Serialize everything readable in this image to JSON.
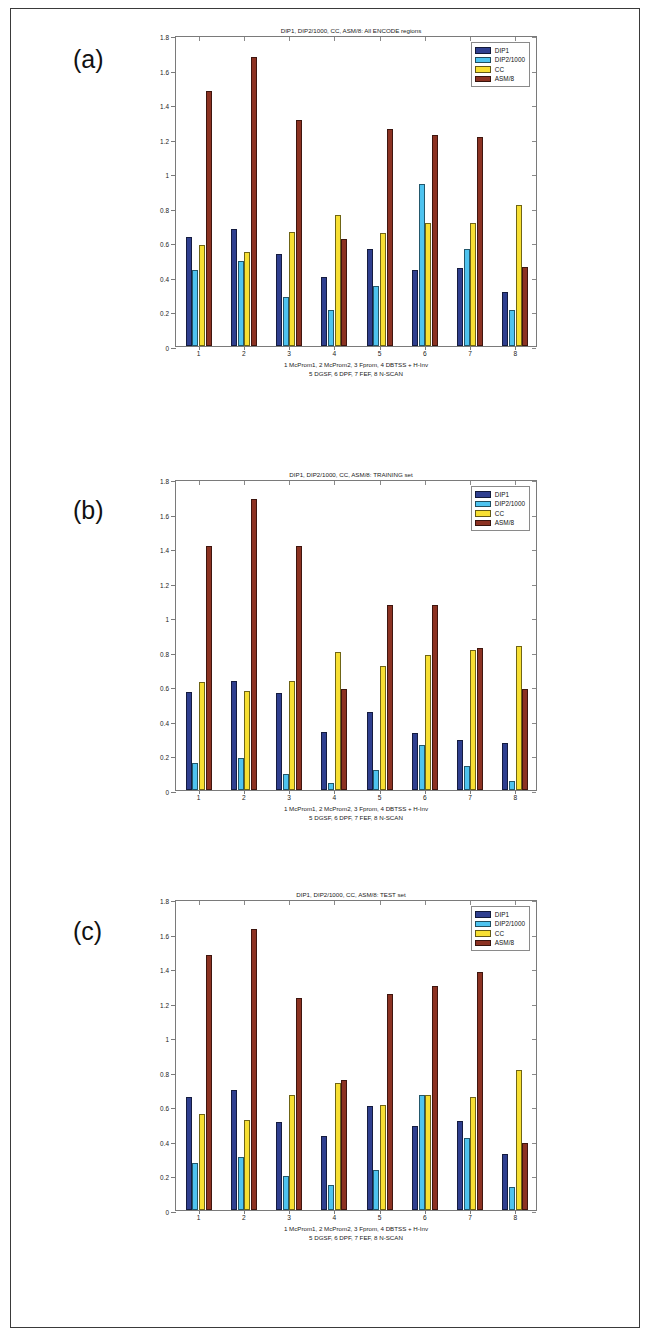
{
  "page": {
    "panels": [
      {
        "letter": "(a)",
        "chart_index": 0
      },
      {
        "letter": "(b)",
        "chart_index": 1
      },
      {
        "letter": "(c)",
        "chart_index": 2
      }
    ]
  },
  "colors": {
    "DIP1": "#2f3f8f",
    "DIP2/1000": "#4ec3ef",
    "CC": "#f7df32",
    "ASM/8": "#8c3222",
    "axis": "#7a7a7a",
    "text": "#1b1b1b",
    "page_border": "#3a3a3a"
  },
  "legend": {
    "position": "top-right",
    "entries": [
      "DIP1",
      "DIP2/1000",
      "CC",
      "ASM/8"
    ]
  },
  "axis": {
    "yticks": [
      "0",
      "0.2",
      "0.4",
      "0.6",
      "0.8",
      "1",
      "1.2",
      "1.4",
      "1.6",
      "1.8"
    ],
    "xticks": [
      "1",
      "2",
      "3",
      "4",
      "5",
      "6",
      "7",
      "8"
    ],
    "ylim_min": 0,
    "ylim_max": 1.8
  },
  "caption": {
    "line1": "1 McProm1, 2 McProm2, 3 Fprom, 4 DBTSS + H-Inv",
    "line2": "5 DGSF,   6 DPF,    7 FEF,   8 N-SCAN"
  },
  "chart_data": [
    {
      "type": "bar",
      "title": "DIP1, DIP2/1000, CC, ASM/8: All ENCODE regions",
      "xlabel": "1 McProm1, 2 McProm2, 3 Fprom, 4 DBTSS + H-Inv   5 DGSF, 6 DPF, 7 FEF, 8 N-SCAN",
      "ylabel": "",
      "ylim": [
        0,
        1.8
      ],
      "grid": false,
      "legend_position": "top-right",
      "categories": [
        "1",
        "2",
        "3",
        "4",
        "5",
        "6",
        "7",
        "8"
      ],
      "series": [
        {
          "name": "DIP1",
          "color": "#2f3f8f",
          "values": [
            0.63,
            0.68,
            0.53,
            0.4,
            0.56,
            0.44,
            0.45,
            0.31
          ]
        },
        {
          "name": "DIP2/1000",
          "color": "#4ec3ef",
          "values": [
            0.44,
            0.49,
            0.285,
            0.21,
            0.35,
            0.94,
            0.56,
            0.21
          ]
        },
        {
          "name": "CC",
          "color": "#f7df32",
          "values": [
            0.585,
            0.545,
            0.66,
            0.76,
            0.655,
            0.71,
            0.71,
            0.815
          ]
        },
        {
          "name": "ASM/8",
          "color": "#8c3222",
          "values": [
            1.475,
            1.67,
            1.31,
            0.62,
            1.255,
            1.22,
            1.21,
            0.46
          ]
        }
      ]
    },
    {
      "type": "bar",
      "title": "DIP1, DIP2/1000, CC, ASM/8: TRAINING set",
      "xlabel": "1 McProm1, 2 McProm2, 3 Fprom, 4 DBTSS + H-Inv   5 DGSF, 6 DPF, 7 FEF, 8 N-SCAN",
      "ylabel": "",
      "ylim": [
        0,
        1.8
      ],
      "grid": false,
      "legend_position": "top-right",
      "categories": [
        "1",
        "2",
        "3",
        "4",
        "5",
        "6",
        "7",
        "8"
      ],
      "series": [
        {
          "name": "DIP1",
          "color": "#2f3f8f",
          "values": [
            0.565,
            0.63,
            0.56,
            0.335,
            0.45,
            0.33,
            0.29,
            0.275
          ]
        },
        {
          "name": "DIP2/1000",
          "color": "#4ec3ef",
          "values": [
            0.155,
            0.185,
            0.09,
            0.04,
            0.115,
            0.26,
            0.14,
            0.055
          ]
        },
        {
          "name": "CC",
          "color": "#f7df32",
          "values": [
            0.625,
            0.575,
            0.63,
            0.8,
            0.715,
            0.78,
            0.81,
            0.835
          ]
        },
        {
          "name": "ASM/8",
          "color": "#8c3222",
          "values": [
            1.41,
            1.685,
            1.41,
            0.585,
            1.07,
            1.07,
            0.82,
            0.585
          ]
        }
      ]
    },
    {
      "type": "bar",
      "title": "DIP1, DIP2/1000, CC, ASM/8: TEST set",
      "xlabel": "1 McProm1, 2 McProm2, 3 Fprom, 4 DBTSS + H-Inv   5 DGSF, 6 DPF, 7 FEF, 8 N-SCAN",
      "ylabel": "",
      "ylim": [
        0,
        1.8
      ],
      "grid": false,
      "legend_position": "top-right",
      "categories": [
        "1",
        "2",
        "3",
        "4",
        "5",
        "6",
        "7",
        "8"
      ],
      "series": [
        {
          "name": "DIP1",
          "color": "#2f3f8f",
          "values": [
            0.655,
            0.695,
            0.51,
            0.43,
            0.6,
            0.485,
            0.515,
            0.325
          ]
        },
        {
          "name": "DIP2/1000",
          "color": "#4ec3ef",
          "values": [
            0.275,
            0.305,
            0.195,
            0.145,
            0.23,
            0.665,
            0.415,
            0.135
          ]
        },
        {
          "name": "CC",
          "color": "#f7df32",
          "values": [
            0.555,
            0.52,
            0.665,
            0.735,
            0.61,
            0.665,
            0.655,
            0.81
          ]
        },
        {
          "name": "ASM/8",
          "color": "#8c3222",
          "values": [
            1.475,
            1.625,
            1.225,
            0.75,
            1.25,
            1.295,
            1.38,
            0.39
          ]
        }
      ]
    }
  ]
}
